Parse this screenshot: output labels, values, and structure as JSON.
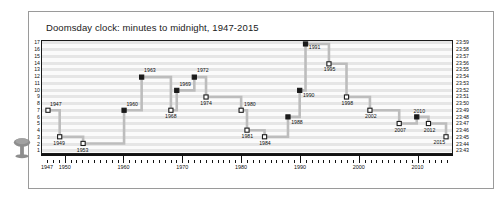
{
  "figure": {
    "title": "Doomsday clock: minutes to midnight, 1947-2015",
    "icon": "mushroom-cloud-icon",
    "background_color": "#ffffff",
    "frame_color": "#9a9a9a",
    "plot_band_color": "#e6e6e6",
    "series_line_color": "#bdbdbd",
    "marker_fill_color": "#1a1a1a",
    "marker_open_color": "#ffffff"
  },
  "chart_data": {
    "type": "line",
    "title": "Doomsday clock: minutes to midnight, 1947-2015",
    "xlabel": "",
    "ylabel": "",
    "xlim": [
      1947,
      2015
    ],
    "ylim": [
      1,
      17
    ],
    "grid": true,
    "legend": "none",
    "step_style": "post",
    "x_ticks": [
      1947,
      1950,
      1960,
      1970,
      1980,
      1990,
      2000,
      2010
    ],
    "x_tick_labels": [
      "1947",
      "1950",
      "1960",
      "1970",
      "1980",
      "1990",
      "2000",
      "2010"
    ],
    "y_ticks": [
      1,
      2,
      3,
      4,
      5,
      6,
      7,
      8,
      9,
      10,
      11,
      12,
      13,
      14,
      15,
      16,
      17
    ],
    "y_tick_labels": [
      "1",
      "2",
      "3",
      "4",
      "5",
      "6",
      "7",
      "8",
      "9",
      "10",
      "11",
      "12",
      "13",
      "14",
      "15",
      "16",
      "17"
    ],
    "y2_tick_labels": [
      "23:43",
      "23:44",
      "23:45",
      "23:46",
      "23:47",
      "23:48",
      "23:49",
      "23:50",
      "23:51",
      "23:52",
      "23:53",
      "23:54",
      "23:55",
      "23:56",
      "23:57",
      "23:58",
      "23:59"
    ],
    "points": [
      {
        "year": 1947,
        "minutes": 7,
        "label": "1947",
        "filled": false,
        "label_pos": "above-right"
      },
      {
        "year": 1949,
        "minutes": 3,
        "label": "1949",
        "filled": false,
        "label_pos": "below"
      },
      {
        "year": 1953,
        "minutes": 2,
        "label": "1953",
        "filled": false,
        "label_pos": "below"
      },
      {
        "year": 1960,
        "minutes": 7,
        "label": "1960",
        "filled": true,
        "label_pos": "above-right"
      },
      {
        "year": 1963,
        "minutes": 12,
        "label": "1963",
        "filled": true,
        "label_pos": "above-right"
      },
      {
        "year": 1968,
        "minutes": 7,
        "label": "1968",
        "filled": false,
        "label_pos": "below"
      },
      {
        "year": 1969,
        "minutes": 10,
        "label": "1969",
        "filled": true,
        "label_pos": "above-right"
      },
      {
        "year": 1972,
        "minutes": 12,
        "label": "1972",
        "filled": true,
        "label_pos": "above-right"
      },
      {
        "year": 1974,
        "minutes": 9,
        "label": "1974",
        "filled": false,
        "label_pos": "below"
      },
      {
        "year": 1980,
        "minutes": 7,
        "label": "1980",
        "filled": false,
        "label_pos": "above-right"
      },
      {
        "year": 1981,
        "minutes": 4,
        "label": "1981",
        "filled": false,
        "label_pos": "below"
      },
      {
        "year": 1984,
        "minutes": 3,
        "label": "1984",
        "filled": false,
        "label_pos": "below"
      },
      {
        "year": 1988,
        "minutes": 6,
        "label": "1988",
        "filled": true,
        "label_pos": "below-right"
      },
      {
        "year": 1990,
        "minutes": 10,
        "label": "1990",
        "filled": true,
        "label_pos": "below-right"
      },
      {
        "year": 1991,
        "minutes": 17,
        "label": "1991",
        "filled": true,
        "label_pos": "below-right"
      },
      {
        "year": 1995,
        "minutes": 14,
        "label": "1995",
        "filled": false,
        "label_pos": "below"
      },
      {
        "year": 1998,
        "minutes": 9,
        "label": "1998",
        "filled": false,
        "label_pos": "below"
      },
      {
        "year": 2002,
        "minutes": 7,
        "label": "2002",
        "filled": false,
        "label_pos": "below"
      },
      {
        "year": 2007,
        "minutes": 5,
        "label": "2007",
        "filled": false,
        "label_pos": "below"
      },
      {
        "year": 2010,
        "minutes": 6,
        "label": "2010",
        "filled": true,
        "label_pos": "above"
      },
      {
        "year": 2012,
        "minutes": 5,
        "label": "2012",
        "filled": false,
        "label_pos": "below"
      },
      {
        "year": 2015,
        "minutes": 3,
        "label": "2015",
        "filled": false,
        "label_pos": "below-left"
      }
    ]
  }
}
